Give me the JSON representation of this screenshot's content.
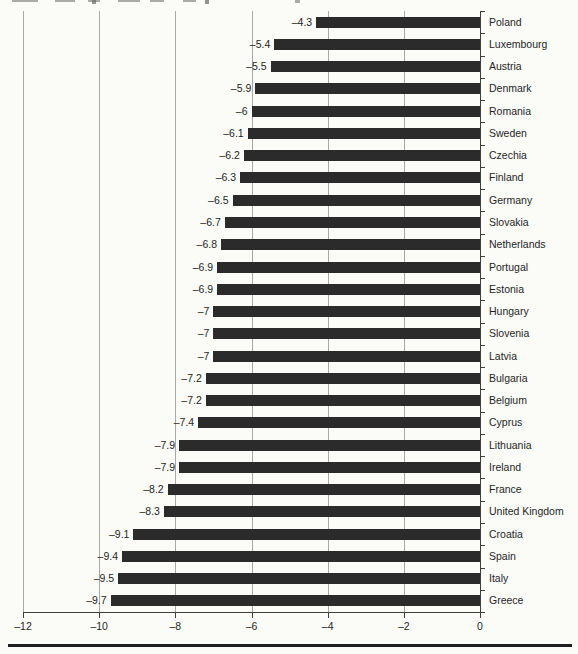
{
  "chart_data": {
    "type": "bar",
    "orientation": "horizontal",
    "title": "",
    "xlabel": "",
    "ylabel": "",
    "categories": [
      "Poland",
      "Luxembourg",
      "Austria",
      "Denmark",
      "Romania",
      "Sweden",
      "Czechia",
      "Finland",
      "Germany",
      "Slovakia",
      "Netherlands",
      "Portugal",
      "Estonia",
      "Hungary",
      "Slovenia",
      "Latvia",
      "Bulgaria",
      "Belgium",
      "Cyprus",
      "Lithuania",
      "Ireland",
      "France",
      "United Kingdom",
      "Croatia",
      "Spain",
      "Italy",
      "Greece"
    ],
    "values": [
      -4.3,
      -5.4,
      -5.5,
      -5.9,
      -6,
      -6.1,
      -6.2,
      -6.3,
      -6.5,
      -6.7,
      -6.8,
      -6.9,
      -6.9,
      -7,
      -7,
      -7,
      -7.2,
      -7.2,
      -7.4,
      -7.9,
      -7.9,
      -8.2,
      -8.3,
      -9.1,
      -9.4,
      -9.5,
      -9.7
    ],
    "value_labels": [
      "–4.3",
      "–5.4",
      "–5.5",
      "–5.9",
      "–6",
      "–6.1",
      "–6.2",
      "–6.3",
      "–6.5",
      "–6.7",
      "–6.8",
      "–6.9",
      "–6.9",
      "–7",
      "–7",
      "–7",
      "–7.2",
      "–7.2",
      "–7.4",
      "–7.9",
      "–7.9",
      "–8.2",
      "–8.3",
      "–9.1",
      "–9.4",
      "–9.5",
      "–9.7"
    ],
    "xlim": [
      -12,
      0
    ],
    "xticks": [
      -12,
      -10,
      -8,
      -6,
      -4,
      -2,
      0
    ],
    "xtick_labels": [
      "–12",
      "–10",
      "–8",
      "–6",
      "–4",
      "–2",
      "0"
    ],
    "grid": true,
    "legend": false,
    "bar_color": "#2b2b2b",
    "gridline_color": "#a8a8a8",
    "axis_color": "#3f3f3f",
    "text_color": "#1f1f1f",
    "background_color": "#fbfbf8"
  }
}
